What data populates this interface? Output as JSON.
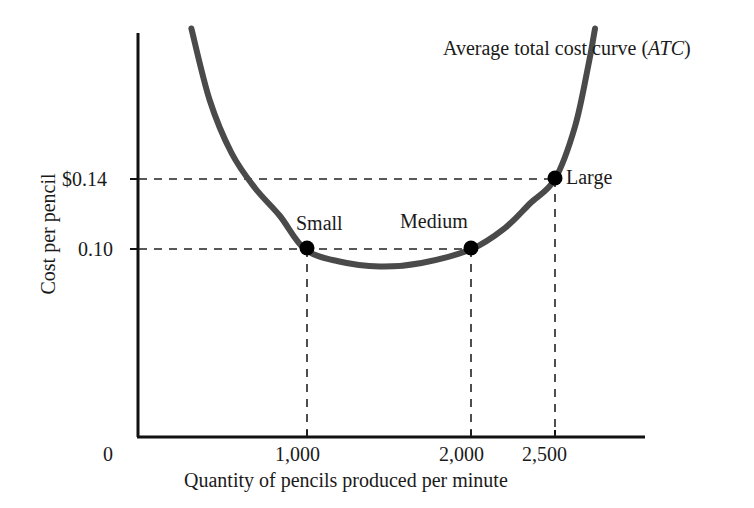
{
  "chart_data": {
    "type": "line",
    "title_plain": "Average total cost curve",
    "title_italic_part": "ATC",
    "xlabel": "Quantity of pencils produced per minute",
    "ylabel": "Cost per pencil",
    "grid": false,
    "legend_position": "none",
    "xlim": [
      0,
      2900
    ],
    "ylim": [
      0,
      0.24
    ],
    "x_ticks": [
      {
        "value": 0,
        "label": "0"
      },
      {
        "value": 1000,
        "label": "1,000"
      },
      {
        "value": 2000,
        "label": "2,000"
      },
      {
        "value": 2500,
        "label": "2,500"
      }
    ],
    "y_ticks": [
      {
        "value": 0.14,
        "label": "$0.14"
      },
      {
        "value": 0.1,
        "label": "0.10"
      }
    ],
    "series": [
      {
        "name": "Average total cost curve (ATC)",
        "color": "#4a4a4a",
        "points": [
          {
            "x": 320,
            "y": 0.226
          },
          {
            "x": 430,
            "y": 0.185
          },
          {
            "x": 560,
            "y": 0.155
          },
          {
            "x": 700,
            "y": 0.135
          },
          {
            "x": 850,
            "y": 0.119
          },
          {
            "x": 1000,
            "y": 0.1
          },
          {
            "x": 1200,
            "y": 0.093
          },
          {
            "x": 1450,
            "y": 0.09
          },
          {
            "x": 1700,
            "y": 0.092
          },
          {
            "x": 2000,
            "y": 0.1
          },
          {
            "x": 2200,
            "y": 0.112
          },
          {
            "x": 2350,
            "y": 0.126
          },
          {
            "x": 2500,
            "y": 0.14
          },
          {
            "x": 2620,
            "y": 0.17
          },
          {
            "x": 2700,
            "y": 0.205
          },
          {
            "x": 2740,
            "y": 0.226
          }
        ]
      }
    ],
    "annotated_points": [
      {
        "label": "Small",
        "x": 1000,
        "y": 0.1
      },
      {
        "label": "Medium",
        "x": 2000,
        "y": 0.1
      },
      {
        "label": "Large",
        "x": 2500,
        "y": 0.14
      }
    ],
    "guide_lines": [
      {
        "type": "horizontal",
        "value": 0.14,
        "to_x": 2500,
        "style": "dashed"
      },
      {
        "type": "horizontal",
        "value": 0.1,
        "to_x": 2000,
        "style": "dashed"
      },
      {
        "type": "vertical",
        "value": 1000,
        "to_y": 0.1,
        "style": "dashed"
      },
      {
        "type": "vertical",
        "value": 2000,
        "to_y": 0.1,
        "style": "dashed"
      },
      {
        "type": "vertical",
        "value": 2500,
        "to_y": 0.14,
        "style": "dashed"
      }
    ],
    "colors": {
      "curve": "#4a4a4a",
      "axis": "#111111",
      "dashed_guide": "#222222",
      "marker": "#000000",
      "background": "#ffffff"
    }
  }
}
